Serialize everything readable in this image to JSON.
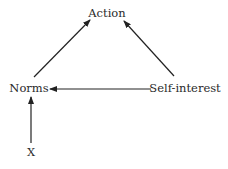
{
  "diagram": {
    "nodes": [
      {
        "id": "action",
        "label": "Action",
        "x": 107,
        "y": 14
      },
      {
        "id": "norms",
        "label": "Norms",
        "x": 29,
        "y": 89
      },
      {
        "id": "self_interest",
        "label": "Self-interest",
        "x": 185,
        "y": 89
      },
      {
        "id": "x",
        "label": "X",
        "x": 31,
        "y": 153
      }
    ],
    "edges": [
      {
        "from": "norms",
        "to": "action"
      },
      {
        "from": "self_interest",
        "to": "action"
      },
      {
        "from": "self_interest",
        "to": "norms"
      },
      {
        "from": "x",
        "to": "norms"
      }
    ],
    "colors": {
      "line": "#222222",
      "text": "#2a2a2a",
      "background": "#ffffff"
    }
  }
}
